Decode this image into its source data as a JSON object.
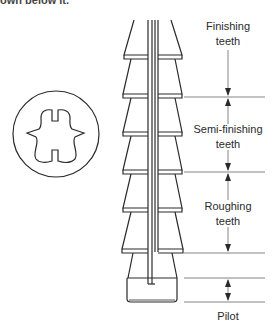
{
  "header": {
    "cut_text": "own below it."
  },
  "figure": {
    "cross_section": {
      "description": "circular cross-section of broach"
    },
    "sections": [
      {
        "id": "finishing",
        "line1": "Finishing",
        "line2": "teeth"
      },
      {
        "id": "semi-finishing",
        "line1": "Semi-finishing",
        "line2": "teeth"
      },
      {
        "id": "roughing",
        "line1": "Roughing",
        "line2": "teeth"
      },
      {
        "id": "pilot",
        "line1": "Pilot"
      }
    ],
    "colors": {
      "stroke": "#2a2a2a",
      "dimension_line": "#777777",
      "background": "#ffffff"
    }
  }
}
